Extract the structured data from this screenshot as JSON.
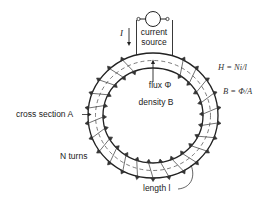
{
  "diagram": {
    "type": "toroidal-coil",
    "source": {
      "label_line1": "current",
      "label_line2": "source",
      "current_symbol": "I"
    },
    "core": {
      "flux_label": "flux Φ",
      "density_label": "density B",
      "cross_section_label": "cross section A",
      "turns_label": "N turns",
      "length_label": "length l"
    },
    "equations": {
      "H": "H = Ni/l",
      "B": "B = Φ/A"
    },
    "colors": {
      "line": "#222222",
      "background": "#ffffff"
    }
  }
}
